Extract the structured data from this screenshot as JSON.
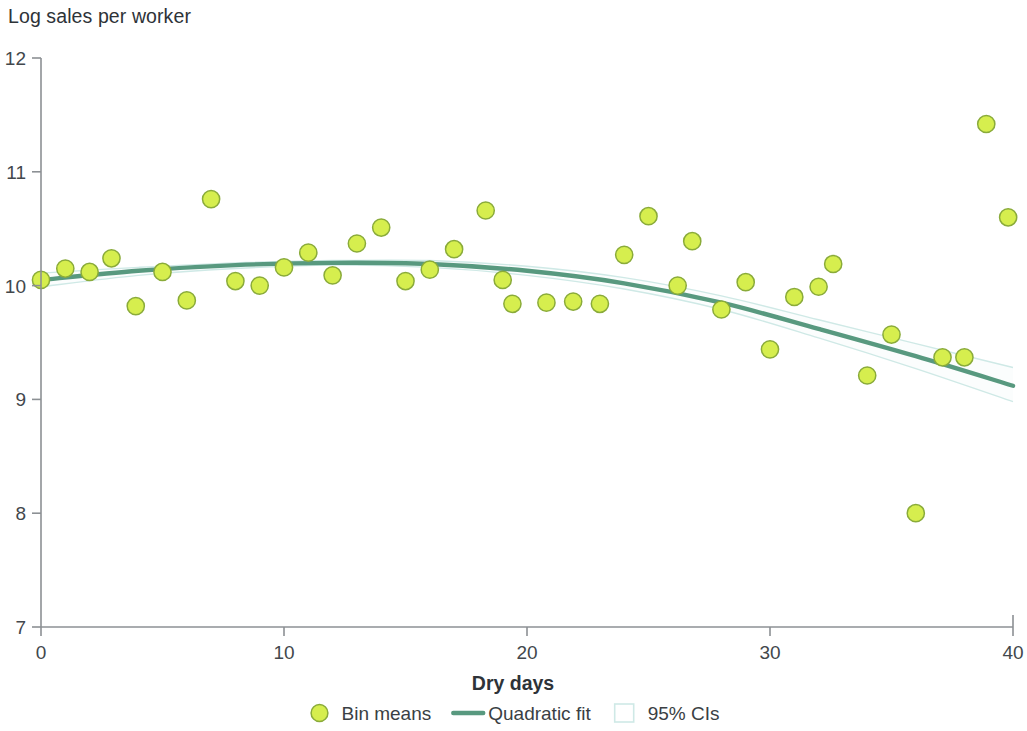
{
  "chart_data": {
    "type": "scatter",
    "title": "Log sales per worker",
    "xlabel": "Dry days",
    "ylabel": "",
    "xlim": [
      0,
      40
    ],
    "ylim": [
      7,
      12
    ],
    "xticks": [
      0,
      10,
      20,
      30,
      40
    ],
    "yticks": [
      7,
      8,
      9,
      10,
      11,
      12
    ],
    "grid": false,
    "legend_position": "bottom",
    "series": [
      {
        "name": "Bin means",
        "type": "scatter",
        "marker_fill": "#d6ee4e",
        "marker_stroke": "#8aab3a",
        "points": [
          {
            "x": 0.0,
            "y": 10.05
          },
          {
            "x": 1.0,
            "y": 10.15
          },
          {
            "x": 2.0,
            "y": 10.12
          },
          {
            "x": 2.9,
            "y": 10.24
          },
          {
            "x": 3.9,
            "y": 9.82
          },
          {
            "x": 5.0,
            "y": 10.12
          },
          {
            "x": 6.0,
            "y": 9.87
          },
          {
            "x": 7.0,
            "y": 10.76
          },
          {
            "x": 8.0,
            "y": 10.04
          },
          {
            "x": 9.0,
            "y": 10.0
          },
          {
            "x": 10.0,
            "y": 10.16
          },
          {
            "x": 11.0,
            "y": 10.29
          },
          {
            "x": 12.0,
            "y": 10.09
          },
          {
            "x": 13.0,
            "y": 10.37
          },
          {
            "x": 14.0,
            "y": 10.51
          },
          {
            "x": 15.0,
            "y": 10.04
          },
          {
            "x": 16.0,
            "y": 10.14
          },
          {
            "x": 17.0,
            "y": 10.32
          },
          {
            "x": 18.3,
            "y": 10.66
          },
          {
            "x": 19.0,
            "y": 10.05
          },
          {
            "x": 19.4,
            "y": 9.84
          },
          {
            "x": 20.8,
            "y": 9.85
          },
          {
            "x": 21.9,
            "y": 9.86
          },
          {
            "x": 23.0,
            "y": 9.84
          },
          {
            "x": 24.0,
            "y": 10.27
          },
          {
            "x": 25.0,
            "y": 10.61
          },
          {
            "x": 26.2,
            "y": 10.0
          },
          {
            "x": 26.8,
            "y": 10.39
          },
          {
            "x": 28.0,
            "y": 9.79
          },
          {
            "x": 29.0,
            "y": 10.03
          },
          {
            "x": 30.0,
            "y": 9.44
          },
          {
            "x": 31.0,
            "y": 9.9
          },
          {
            "x": 32.0,
            "y": 9.99
          },
          {
            "x": 32.6,
            "y": 10.19
          },
          {
            "x": 34.0,
            "y": 9.21
          },
          {
            "x": 35.0,
            "y": 9.57
          },
          {
            "x": 36.0,
            "y": 8.0
          },
          {
            "x": 37.1,
            "y": 9.37
          },
          {
            "x": 38.0,
            "y": 9.37
          },
          {
            "x": 38.9,
            "y": 11.42
          },
          {
            "x": 39.8,
            "y": 10.6
          }
        ]
      },
      {
        "name": "Quadratic fit",
        "type": "line",
        "color": "#58997f",
        "equation_points": [
          {
            "x": 0,
            "y": 10.05
          },
          {
            "x": 4,
            "y": 10.13
          },
          {
            "x": 8,
            "y": 10.18
          },
          {
            "x": 12,
            "y": 10.2
          },
          {
            "x": 16,
            "y": 10.19
          },
          {
            "x": 20,
            "y": 10.13
          },
          {
            "x": 24,
            "y": 10.02
          },
          {
            "x": 28,
            "y": 9.85
          },
          {
            "x": 32,
            "y": 9.62
          },
          {
            "x": 36,
            "y": 9.38
          },
          {
            "x": 40,
            "y": 9.12
          }
        ]
      },
      {
        "name": "95% CIs",
        "type": "band",
        "color": "#cfe9e6",
        "upper": [
          {
            "x": 0,
            "y": 10.11
          },
          {
            "x": 4,
            "y": 10.16
          },
          {
            "x": 8,
            "y": 10.2
          },
          {
            "x": 12,
            "y": 10.22
          },
          {
            "x": 16,
            "y": 10.22
          },
          {
            "x": 20,
            "y": 10.17
          },
          {
            "x": 24,
            "y": 10.07
          },
          {
            "x": 28,
            "y": 9.91
          },
          {
            "x": 32,
            "y": 9.7
          },
          {
            "x": 36,
            "y": 9.49
          },
          {
            "x": 40,
            "y": 9.28
          }
        ],
        "lower": [
          {
            "x": 0,
            "y": 9.99
          },
          {
            "x": 4,
            "y": 10.09
          },
          {
            "x": 8,
            "y": 10.15
          },
          {
            "x": 12,
            "y": 10.18
          },
          {
            "x": 16,
            "y": 10.16
          },
          {
            "x": 20,
            "y": 10.09
          },
          {
            "x": 24,
            "y": 9.97
          },
          {
            "x": 28,
            "y": 9.79
          },
          {
            "x": 32,
            "y": 9.54
          },
          {
            "x": 36,
            "y": 9.27
          },
          {
            "x": 40,
            "y": 8.98
          }
        ]
      }
    ]
  },
  "legend": {
    "items": [
      {
        "label": "Bin means",
        "marker": "circle-marker"
      },
      {
        "label": "Quadratic fit",
        "marker": "line-marker"
      },
      {
        "label": "95% CIs",
        "marker": "band-marker"
      }
    ]
  },
  "colors": {
    "marker_fill": "#d6ee4e",
    "marker_stroke": "#8aab3a",
    "fit_line": "#58997f",
    "ci_band_stroke": "#cfe9e6",
    "axis": "#8c9094",
    "text": "#2e3338"
  }
}
